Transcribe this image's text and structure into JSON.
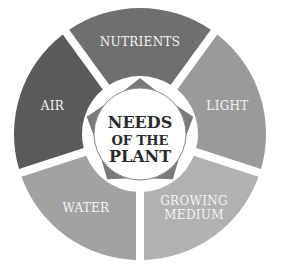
{
  "diagram": {
    "title": [
      "Needs",
      "of the",
      "Plant"
    ],
    "segments": [
      {
        "label": [
          "NUTRIENTS"
        ],
        "color": "#6f6f6f"
      },
      {
        "label": [
          "LIGHT"
        ],
        "color": "#9a9a9a"
      },
      {
        "label": [
          "GROWING",
          "MEDIUM"
        ],
        "color": "#b1b1b1"
      },
      {
        "label": [
          "WATER"
        ],
        "color": "#a2a2a2"
      },
      {
        "label": [
          "AIR"
        ],
        "color": "#5a5a5a"
      }
    ],
    "center_fill": "#ffffff",
    "star_color": "#7a7a7a"
  }
}
